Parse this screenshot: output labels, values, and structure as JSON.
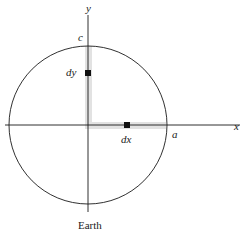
{
  "diagram": {
    "axes": {
      "x_label": "x",
      "y_label": "y"
    },
    "points": {
      "a_label": "a",
      "c_label": "c"
    },
    "elements": {
      "dx_label": "dx",
      "dy_label": "dy"
    },
    "caption": "Earth",
    "colors": {
      "stroke": "#1a1a1a",
      "strip": "#e2e2e2",
      "element": "#111111",
      "background": "#ffffff"
    }
  }
}
